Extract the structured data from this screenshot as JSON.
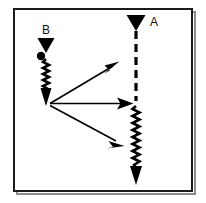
{
  "figure": {
    "title": "",
    "background_color": "#ffffff",
    "ink_color": "#000000",
    "frame": {
      "name": "figure-border",
      "x": 14,
      "y": 9,
      "width": 178,
      "height": 182,
      "stroke_color": "#1a1a1a",
      "stroke_width": 2,
      "shadow_color": "#8c8c8c"
    },
    "nodes": [
      {
        "id": "B",
        "label": "B",
        "label_position": "above",
        "label_x": 46,
        "label_y": 34,
        "marker": "down-triangle",
        "marker_x": 46,
        "marker_y": 38,
        "marker_width": 17,
        "marker_height": 15
      },
      {
        "id": "A",
        "label": "A",
        "label_position": "right",
        "label_x": 150,
        "label_y": 26,
        "marker": "down-triangle",
        "marker_x": 136,
        "marker_y": 15,
        "marker_width": 19,
        "marker_height": 16
      }
    ],
    "dot": {
      "name": "event-dot",
      "x": 41,
      "y": 56,
      "radius": 4
    },
    "paths": [
      {
        "id": "B-zigzag",
        "style": "zigzag",
        "from_x": 46,
        "from_y": 59,
        "to_x": 46,
        "to_y": 90,
        "arrowhead": "solid-down",
        "arrow_tip_x": 46,
        "arrow_tip_y": 105
      },
      {
        "id": "A-dashed",
        "style": "dashed",
        "from_x": 136,
        "from_y": 32,
        "to_x": 136,
        "to_y": 101,
        "arrowhead": "none"
      },
      {
        "id": "A-zigzag",
        "style": "zigzag",
        "from_x": 136,
        "from_y": 106,
        "to_x": 136,
        "to_y": 168,
        "arrowhead": "solid-down",
        "arrow_tip_x": 136,
        "arrow_tip_y": 184
      },
      {
        "id": "arrow-upper",
        "style": "solid-arrow",
        "from_x": 50,
        "from_y": 104,
        "to_x": 119,
        "to_y": 62
      },
      {
        "id": "arrow-middle",
        "style": "solid-arrow",
        "from_x": 50,
        "from_y": 104,
        "to_x": 133,
        "to_y": 103
      },
      {
        "id": "arrow-lower",
        "style": "solid-arrow",
        "from_x": 50,
        "from_y": 106,
        "to_x": 124,
        "to_y": 146
      }
    ],
    "junction": {
      "name": "scatter-vertex",
      "x": 48,
      "y": 104
    }
  }
}
